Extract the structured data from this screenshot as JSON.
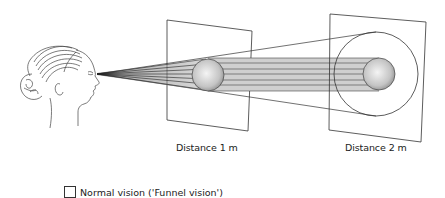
{
  "figure": {
    "labels": {
      "distance1": "Distance 1 m",
      "distance2": "Distance 2 m"
    },
    "legend": {
      "items": [
        {
          "label": "Normal vision ('Funnel vision')",
          "swatch_color": "#ffffff"
        }
      ]
    },
    "elements": {
      "viewer": "head-profile-illustration",
      "panel1": "projection-plane at distance 1 m with sphere",
      "panel2": "projection-plane at distance 2 m with sphere and enclosing circle"
    },
    "colors": {
      "line": "#333333",
      "beam_fill": "#c8c8c8",
      "sphere_light": "#f2f2f2",
      "sphere_dark": "#9a9a9a"
    }
  }
}
